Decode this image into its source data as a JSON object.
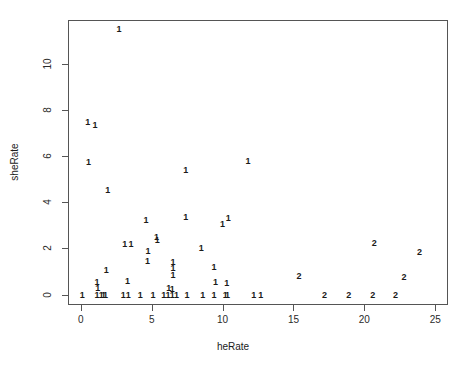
{
  "chart_data": {
    "type": "scatter",
    "title": "",
    "xlabel": "heRate",
    "ylabel": "sheRate",
    "xlim": [
      -0.9,
      25.9
    ],
    "ylim": [
      -0.45,
      11.9
    ],
    "xticks": [
      0,
      5,
      10,
      15,
      20,
      25
    ],
    "yticks": [
      0,
      2,
      4,
      6,
      8,
      10
    ],
    "xtick_labels": [
      "0",
      "5",
      "10",
      "15",
      "20",
      "25"
    ],
    "ytick_labels": [
      "0",
      "2",
      "4",
      "6",
      "8",
      "10"
    ],
    "grid": false,
    "legend": false,
    "marker_style": "text-label-by-group",
    "groups": [
      "1",
      "2"
    ],
    "points": [
      {
        "x": 2.7,
        "y": 11.5,
        "label": "1"
      },
      {
        "x": 0.5,
        "y": 7.5,
        "label": "1"
      },
      {
        "x": 1.0,
        "y": 7.35,
        "label": "1"
      },
      {
        "x": 0.55,
        "y": 5.75,
        "label": "1"
      },
      {
        "x": 11.8,
        "y": 5.8,
        "label": "1"
      },
      {
        "x": 7.4,
        "y": 5.4,
        "label": "1"
      },
      {
        "x": 1.9,
        "y": 4.55,
        "label": "1"
      },
      {
        "x": 7.4,
        "y": 3.35,
        "label": "1"
      },
      {
        "x": 4.6,
        "y": 3.25,
        "label": "1"
      },
      {
        "x": 10.4,
        "y": 3.3,
        "label": "1"
      },
      {
        "x": 10.0,
        "y": 3.05,
        "label": "1"
      },
      {
        "x": 5.35,
        "y": 2.5,
        "label": "1"
      },
      {
        "x": 5.4,
        "y": 2.35,
        "label": "1"
      },
      {
        "x": 20.7,
        "y": 2.25,
        "label": "2"
      },
      {
        "x": 3.1,
        "y": 2.2,
        "label": "1"
      },
      {
        "x": 3.55,
        "y": 2.2,
        "label": "1"
      },
      {
        "x": 8.5,
        "y": 2.0,
        "label": "1"
      },
      {
        "x": 4.75,
        "y": 1.9,
        "label": "1"
      },
      {
        "x": 23.9,
        "y": 1.85,
        "label": "2"
      },
      {
        "x": 4.7,
        "y": 1.45,
        "label": "1"
      },
      {
        "x": 6.5,
        "y": 1.4,
        "label": "1"
      },
      {
        "x": 6.5,
        "y": 1.15,
        "label": "1"
      },
      {
        "x": 9.4,
        "y": 1.2,
        "label": "1"
      },
      {
        "x": 1.8,
        "y": 1.05,
        "label": "1"
      },
      {
        "x": 6.5,
        "y": 0.85,
        "label": "1"
      },
      {
        "x": 15.4,
        "y": 0.8,
        "label": "2"
      },
      {
        "x": 22.8,
        "y": 0.75,
        "label": "2"
      },
      {
        "x": 1.15,
        "y": 0.55,
        "label": "1"
      },
      {
        "x": 3.3,
        "y": 0.6,
        "label": "1"
      },
      {
        "x": 9.5,
        "y": 0.55,
        "label": "1"
      },
      {
        "x": 10.3,
        "y": 0.5,
        "label": "1"
      },
      {
        "x": 1.2,
        "y": 0.3,
        "label": "1"
      },
      {
        "x": 6.2,
        "y": 0.3,
        "label": "1"
      },
      {
        "x": 6.45,
        "y": 0.25,
        "label": "1"
      },
      {
        "x": 0.1,
        "y": 0.0,
        "label": "1"
      },
      {
        "x": 1.15,
        "y": 0.0,
        "label": "1"
      },
      {
        "x": 1.45,
        "y": 0.0,
        "label": "1"
      },
      {
        "x": 1.6,
        "y": 0.0,
        "label": "1"
      },
      {
        "x": 1.75,
        "y": 0.0,
        "label": "1"
      },
      {
        "x": 3.0,
        "y": 0.0,
        "label": "1"
      },
      {
        "x": 3.35,
        "y": 0.0,
        "label": "1"
      },
      {
        "x": 4.2,
        "y": 0.0,
        "label": "1"
      },
      {
        "x": 5.1,
        "y": 0.0,
        "label": "1"
      },
      {
        "x": 5.85,
        "y": 0.0,
        "label": "1"
      },
      {
        "x": 6.15,
        "y": 0.0,
        "label": "1"
      },
      {
        "x": 6.45,
        "y": 0.0,
        "label": "1"
      },
      {
        "x": 6.75,
        "y": 0.0,
        "label": "1"
      },
      {
        "x": 7.5,
        "y": 0.0,
        "label": "1"
      },
      {
        "x": 8.6,
        "y": 0.0,
        "label": "1"
      },
      {
        "x": 9.4,
        "y": 0.0,
        "label": "1"
      },
      {
        "x": 10.2,
        "y": 0.0,
        "label": "1"
      },
      {
        "x": 10.35,
        "y": 0.0,
        "label": "1"
      },
      {
        "x": 12.2,
        "y": 0.0,
        "label": "1"
      },
      {
        "x": 12.7,
        "y": 0.0,
        "label": "1"
      },
      {
        "x": 17.2,
        "y": 0.0,
        "label": "2"
      },
      {
        "x": 18.9,
        "y": 0.0,
        "label": "2"
      },
      {
        "x": 20.6,
        "y": 0.0,
        "label": "2"
      },
      {
        "x": 22.2,
        "y": 0.0,
        "label": "2"
      }
    ]
  },
  "axes": {
    "x_title": "heRate",
    "y_title": "sheRate"
  },
  "colors": {
    "background": "#ffffff",
    "frame": "#555555",
    "text": "#1a1a1a"
  }
}
